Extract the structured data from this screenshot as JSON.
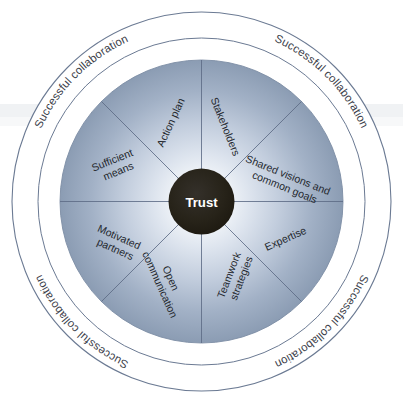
{
  "diagram": {
    "hub": {
      "label": "Trust",
      "fill": "#231f17",
      "text_color": "#ffffff"
    },
    "outer_ring": {
      "labels": [
        {
          "text": "Successful collaboration",
          "position": "top"
        },
        {
          "text": "Successful collaboration",
          "position": "right"
        },
        {
          "text": "Successful collaboration",
          "position": "bottom"
        },
        {
          "text": "Successful collaboration",
          "position": "left"
        }
      ],
      "stroke": "#6b7a93",
      "fill": "#ffffff"
    },
    "disc": {
      "gradient_center": "#fdfdfe",
      "gradient_mid": "#c3cede",
      "gradient_edge": "#8b9cb3",
      "spoke_stroke": "#5d6c85"
    },
    "sectors": [
      {
        "id": "stakeholders",
        "label": "Stakeholders",
        "lines": [
          "Stakeholders"
        ]
      },
      {
        "id": "shared-visions",
        "label": "Shared visions and common goals",
        "lines": [
          "Shared visions and",
          "common goals"
        ]
      },
      {
        "id": "expertise",
        "label": "Expertise",
        "lines": [
          "Expertise"
        ]
      },
      {
        "id": "teamwork-strategies",
        "label": "Teamwork strategies",
        "lines": [
          "Teamwork",
          "strategies"
        ]
      },
      {
        "id": "open-communication",
        "label": "Open communication",
        "lines": [
          "Open",
          "communication"
        ]
      },
      {
        "id": "motivated-partners",
        "label": "Motivated partners",
        "lines": [
          "Motivated",
          "partners"
        ]
      },
      {
        "id": "sufficient-means",
        "label": "Sufficient means",
        "lines": [
          "Sufficient",
          "means"
        ]
      },
      {
        "id": "action-plan",
        "label": "Action plan",
        "lines": [
          "Action plan"
        ]
      }
    ]
  }
}
